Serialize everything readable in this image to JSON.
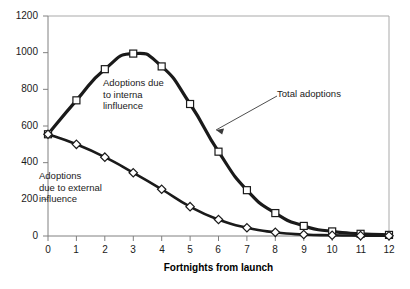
{
  "chart_data": {
    "type": "line",
    "title": "",
    "xlabel": "Fortnights from launch",
    "ylabel": "",
    "x": [
      0,
      1,
      2,
      3,
      4,
      5,
      6,
      7,
      8,
      9,
      10,
      11,
      12
    ],
    "xlim": [
      0,
      12
    ],
    "ylim": [
      0,
      1200
    ],
    "grid": false,
    "legend": "none (inline annotations)",
    "xticklabels": [
      "0",
      "1",
      "2",
      "3",
      "4",
      "5",
      "6",
      "7",
      "8",
      "9",
      "10",
      "11",
      "12"
    ],
    "yticklabels": [
      "0",
      "200",
      "400",
      "600",
      "800",
      "1000",
      "1200"
    ],
    "yticks": [
      0,
      200,
      400,
      600,
      800,
      1000,
      1200
    ],
    "series": [
      {
        "name": "Total adoptions",
        "marker": "square",
        "values": [
          555,
          740,
          910,
          995,
          925,
          720,
          460,
          250,
          125,
          55,
          25,
          12,
          6
        ]
      },
      {
        "name": "Adoptions due to external influence",
        "marker": "diamond",
        "values": [
          555,
          500,
          430,
          345,
          255,
          160,
          90,
          45,
          20,
          8,
          4,
          2,
          1
        ]
      }
    ],
    "annotations": [
      {
        "name": "internal-influence-label",
        "text": "Adoptions due\nto interna\nlinfluence"
      },
      {
        "name": "external-influence-label",
        "text": "Adoptions\ndue to external\ninfluence"
      },
      {
        "name": "total-adoptions-label",
        "text": "Total adoptions"
      }
    ]
  },
  "colors": {
    "series_line": "#1a1a1a",
    "marker_fill": "#ffffff",
    "axis": "#808080",
    "text": "#1a1a1a",
    "background": "#ffffff"
  }
}
